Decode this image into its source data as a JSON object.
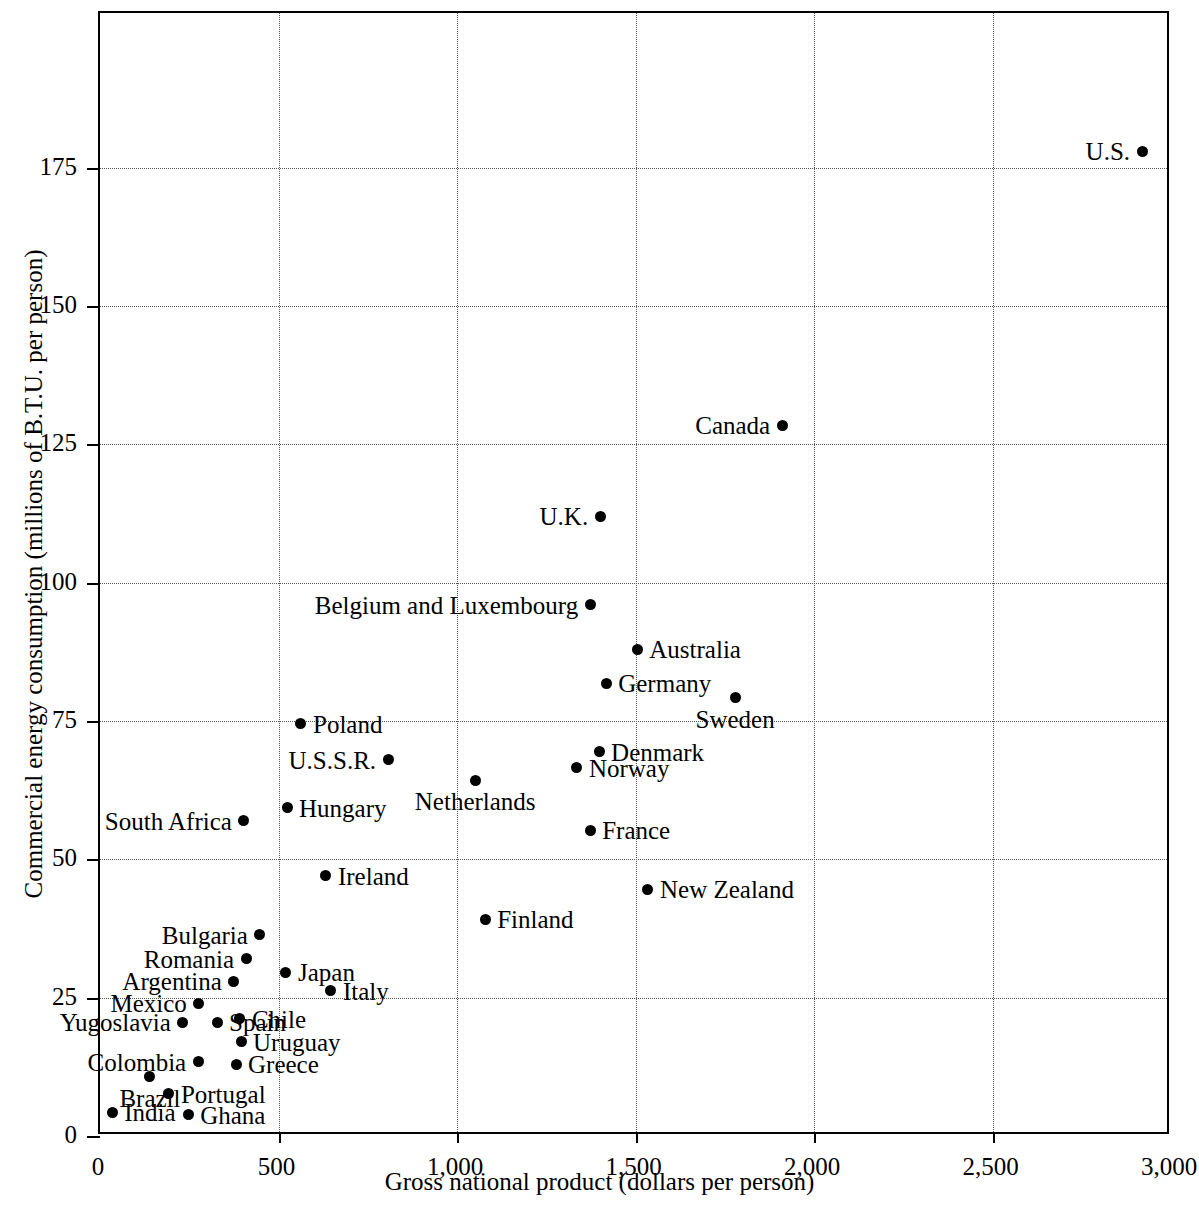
{
  "chart_data": {
    "type": "scatter",
    "title": "",
    "xlabel": "Gross national product (dollars per person)",
    "ylabel": "Commercial energy consumption (millions of B.T.U. per person)",
    "xlim": [
      0,
      3000
    ],
    "ylim": [
      0,
      203
    ],
    "xticks": [
      0,
      500,
      1000,
      1500,
      2000,
      2500,
      3000
    ],
    "xticklabels": [
      "0",
      "500",
      "1,000",
      "1,500",
      "2,000",
      "2,500",
      "3,000"
    ],
    "yticks": [
      0,
      25,
      50,
      75,
      100,
      125,
      150,
      175
    ],
    "yticklabels": [
      "0",
      "25",
      "50",
      "75",
      "100",
      "125",
      "150",
      "175"
    ],
    "grid": true,
    "grid_style": "dotted",
    "legend": false,
    "point_color": "#000000",
    "frame_color": "#000000",
    "background_color": "#ffffff",
    "points": [
      {
        "name": "U.S.",
        "x": 2919,
        "y": 178.0,
        "label_pos": "left"
      },
      {
        "name": "Canada",
        "x": 1911,
        "y": 128.5,
        "label_pos": "left"
      },
      {
        "name": "U.K.",
        "x": 1401,
        "y": 112.0,
        "label_pos": "left"
      },
      {
        "name": "Belgium and Luxembourg",
        "x": 1373,
        "y": 96.0,
        "label_pos": "left"
      },
      {
        "name": "Australia",
        "x": 1505,
        "y": 88.0,
        "label_pos": "right"
      },
      {
        "name": "Germany",
        "x": 1418,
        "y": 81.8,
        "label_pos": "right"
      },
      {
        "name": "Sweden",
        "x": 1779,
        "y": 79.2,
        "label_pos": "below"
      },
      {
        "name": "Poland",
        "x": 563,
        "y": 74.5,
        "label_pos": "right"
      },
      {
        "name": "U.S.S.R.",
        "x": 807,
        "y": 68.0,
        "label_pos": "left"
      },
      {
        "name": "Denmark",
        "x": 1398,
        "y": 69.5,
        "label_pos": "right"
      },
      {
        "name": "Norway",
        "x": 1336,
        "y": 66.6,
        "label_pos": "right"
      },
      {
        "name": "Netherlands",
        "x": 1051,
        "y": 64.3,
        "label_pos": "below"
      },
      {
        "name": "Hungary",
        "x": 524,
        "y": 59.3,
        "label_pos": "right"
      },
      {
        "name": "South Africa",
        "x": 403,
        "y": 57.0,
        "label_pos": "left"
      },
      {
        "name": "France",
        "x": 1373,
        "y": 55.3,
        "label_pos": "right"
      },
      {
        "name": "Ireland",
        "x": 633,
        "y": 47.0,
        "label_pos": "right"
      },
      {
        "name": "New Zealand",
        "x": 1535,
        "y": 44.6,
        "label_pos": "right"
      },
      {
        "name": "Finland",
        "x": 1079,
        "y": 39.2,
        "label_pos": "right"
      },
      {
        "name": "Bulgaria",
        "x": 448,
        "y": 36.4,
        "label_pos": "left"
      },
      {
        "name": "Romania",
        "x": 409,
        "y": 32.0,
        "label_pos": "left"
      },
      {
        "name": "Japan",
        "x": 521,
        "y": 29.6,
        "label_pos": "right"
      },
      {
        "name": "Argentina",
        "x": 375,
        "y": 28.0,
        "label_pos": "left"
      },
      {
        "name": "Italy",
        "x": 647,
        "y": 26.3,
        "label_pos": "right"
      },
      {
        "name": "Mexico",
        "x": 277,
        "y": 24.0,
        "label_pos": "left"
      },
      {
        "name": "Spain",
        "x": 328,
        "y": 20.6,
        "label_pos": "right"
      },
      {
        "name": "Yugoslavia",
        "x": 232,
        "y": 20.6,
        "label_pos": "left"
      },
      {
        "name": "Chile",
        "x": 392,
        "y": 21.2,
        "label_pos": "right"
      },
      {
        "name": "Uruguay",
        "x": 395,
        "y": 17.0,
        "label_pos": "right"
      },
      {
        "name": "Colombia",
        "x": 275,
        "y": 13.4,
        "label_pos": "left"
      },
      {
        "name": "Greece",
        "x": 381,
        "y": 13.0,
        "label_pos": "right"
      },
      {
        "name": "Brazil",
        "x": 140,
        "y": 10.7,
        "label_pos": "below"
      },
      {
        "name": "Portugal",
        "x": 193,
        "y": 7.6,
        "label_pos": "right"
      },
      {
        "name": "India",
        "x": 34,
        "y": 4.3,
        "label_pos": "right"
      },
      {
        "name": "Ghana",
        "x": 247,
        "y": 3.8,
        "label_pos": "right"
      }
    ]
  }
}
